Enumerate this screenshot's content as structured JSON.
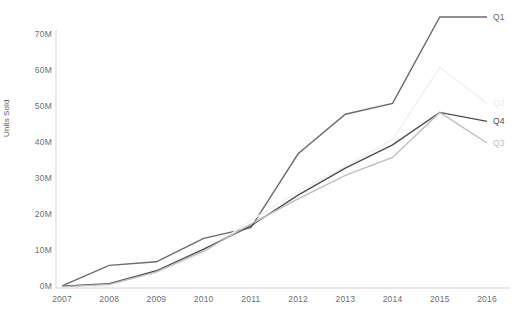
{
  "chart_data": {
    "type": "line",
    "title": "",
    "xlabel": "",
    "ylabel": "Units Sold",
    "categories": [
      "2007",
      "2008",
      "2009",
      "2010",
      "2011",
      "2012",
      "2013",
      "2014",
      "2015",
      "2016"
    ],
    "x": [
      2007,
      2008,
      2009,
      2010,
      2011,
      2012,
      2013,
      2014,
      2015,
      2016
    ],
    "xlim": [
      2007,
      2016
    ],
    "ylim": [
      0,
      75
    ],
    "y_unit": "M",
    "grid": false,
    "legend_position": "right-of-line-ends",
    "y_ticks": [
      {
        "label": "0M",
        "value": 0
      },
      {
        "label": "10M",
        "value": 10
      },
      {
        "label": "20M",
        "value": 20
      },
      {
        "label": "30M",
        "value": 30
      },
      {
        "label": "40M",
        "value": 40
      },
      {
        "label": "50M",
        "value": 50
      },
      {
        "label": "60M",
        "value": 60
      },
      {
        "label": "70M",
        "value": 70
      }
    ],
    "series": [
      {
        "name": "Q1",
        "color": "#6b6b6d",
        "values": [
          0.3,
          6.0,
          7.0,
          13.5,
          16.5,
          37.0,
          48.0,
          51.0,
          75.0,
          75.0
        ]
      },
      {
        "name": "Q2",
        "color": "#f0f0f0",
        "values": [
          0.2,
          0.8,
          4.0,
          9.5,
          18.5,
          26.5,
          33.5,
          41.0,
          61.0,
          51.0
        ]
      },
      {
        "name": "Q4",
        "color": "#4d4d4f",
        "values": [
          0.2,
          0.9,
          4.5,
          10.5,
          17.0,
          25.5,
          33.0,
          39.5,
          48.5,
          46.0
        ]
      },
      {
        "name": "Q3",
        "color": "#bdbdbd",
        "values": [
          0.1,
          0.7,
          4.2,
          10.0,
          17.5,
          24.5,
          31.0,
          36.0,
          48.5,
          40.0
        ]
      }
    ]
  }
}
